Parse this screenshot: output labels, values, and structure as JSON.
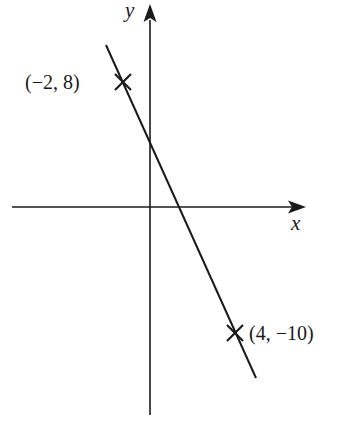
{
  "diagram": {
    "type": "coordinate-plane-line",
    "colors": {
      "ink": "#1a1a1a",
      "background": "#ffffff"
    },
    "axes": {
      "x_label": "x",
      "y_label": "y"
    },
    "line": {
      "description": "straight line through two marked points",
      "slope": -3,
      "y_intercept": 2
    },
    "points": [
      {
        "label": "(−2, 8)",
        "x": -2,
        "y": 8,
        "marker": "cross"
      },
      {
        "label": "(4, −10)",
        "x": 4,
        "y": -10,
        "marker": "cross"
      }
    ]
  }
}
